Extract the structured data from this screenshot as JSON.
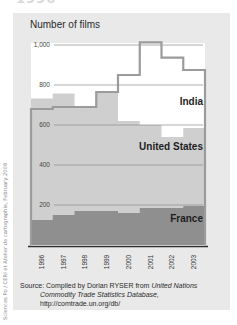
{
  "heading_cut": "1996-2003",
  "credit": "Sciences Po / CERI et Atelier de cartographie, February 2008",
  "chart_data": {
    "type": "area",
    "title": "Number of films",
    "xlabel": "",
    "ylabel": "Number of films",
    "ylim": [
      0,
      1000
    ],
    "yticks": [
      200,
      400,
      600,
      800,
      1000
    ],
    "ytick_labels": [
      "200",
      "400",
      "600",
      "800",
      "1,000"
    ],
    "categories": [
      "1996",
      "1997",
      "1998",
      "1999",
      "2000",
      "2001",
      "2002",
      "2003"
    ],
    "grid": true,
    "series": [
      {
        "name": "India",
        "style": "step-line",
        "color": "#9e9e9e",
        "values": [
          680,
          690,
          690,
          765,
          850,
          1013,
          937,
          875
        ]
      },
      {
        "name": "United States",
        "style": "step-area",
        "color": "#cfcfcf",
        "values": [
          733,
          758,
          685,
          765,
          620,
          600,
          540,
          585
        ]
      },
      {
        "name": "France",
        "style": "step-area",
        "color": "#8f8f8f",
        "values": [
          125,
          150,
          170,
          170,
          160,
          185,
          185,
          195
        ]
      }
    ],
    "legend": "inline labels at right"
  },
  "source": {
    "prefix": "Source: Compiled by Dorian RYSER from ",
    "italic1": "United Nations",
    "italic2": "Commodity Trade Statistics Database,",
    "url": "http://comtrade.un.org/db/"
  }
}
